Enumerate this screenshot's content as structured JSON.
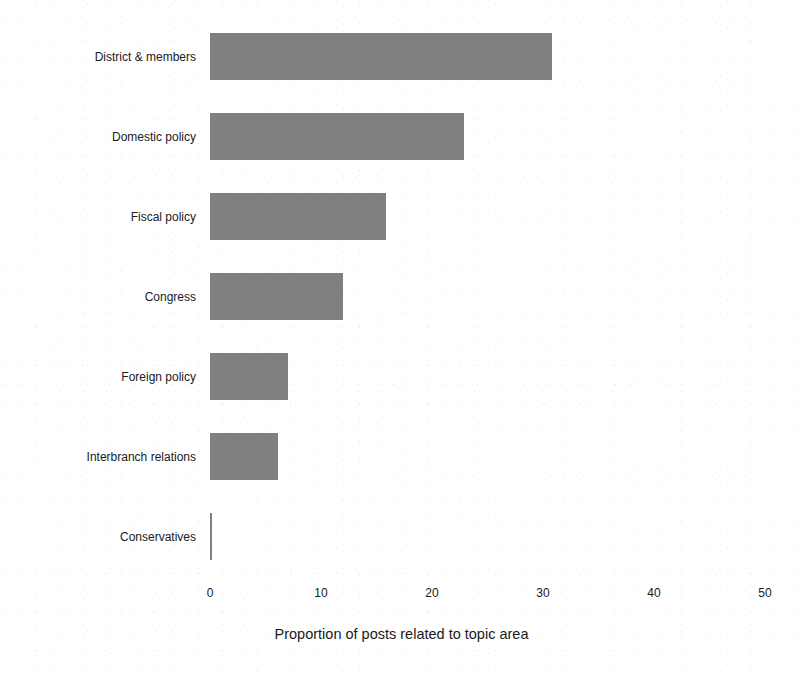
{
  "chart_data": {
    "type": "bar",
    "orientation": "horizontal",
    "title": "",
    "xlabel": "Proportion of posts related to topic area",
    "ylabel": "",
    "categories": [
      "District & members",
      "Domestic policy",
      "Fiscal policy",
      "Congress",
      "Foreign policy",
      "Interbranch relations",
      "Conservatives"
    ],
    "values": [
      30.8,
      22.9,
      15.9,
      12.0,
      7.0,
      6.1,
      0.2
    ],
    "xlim": [
      0,
      50
    ],
    "xticks": [
      0,
      10,
      20,
      30,
      40,
      50
    ],
    "xtick_labels": [
      "0",
      "10",
      "20",
      "30",
      "40",
      "50"
    ],
    "grid": false,
    "legend": false,
    "bar_color": "#808080",
    "background_color": "#ffffff",
    "text_color": "#1a1a1a"
  }
}
